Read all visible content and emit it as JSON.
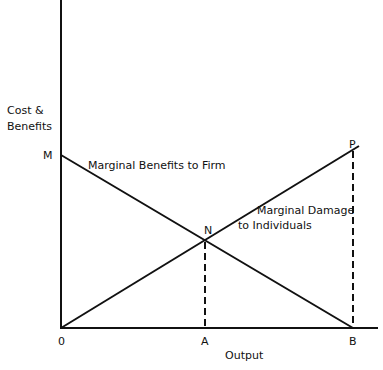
{
  "diagram": {
    "y_axis_label_line1": "Cost &",
    "y_axis_label_line2": "Benefits",
    "x_axis_label": "Output",
    "points": {
      "M": "M",
      "N": "N",
      "P": "P",
      "origin": "0",
      "A": "A",
      "B": "B"
    },
    "curves": {
      "benefits": "Marginal Benefits to Firm",
      "damage_line1": "Marginal Damage",
      "damage_line2": "to Individuals"
    },
    "colors": {
      "line": "#111111",
      "background": "#ffffff"
    }
  }
}
